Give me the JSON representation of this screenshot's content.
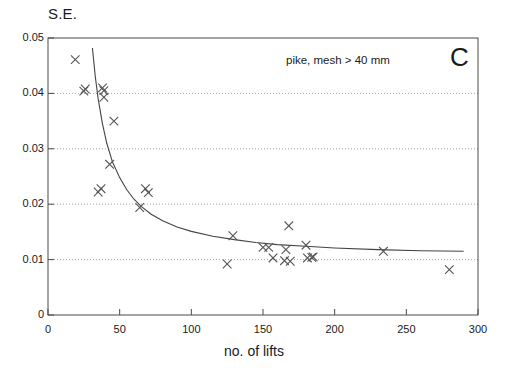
{
  "chart_data": {
    "type": "scatter",
    "title": "",
    "annotation": "pike, mesh > 40 mm",
    "panel_label": "C",
    "xlabel": "no. of lifts",
    "ylabel": "S.E.",
    "xlim": [
      0,
      300
    ],
    "ylim": [
      0,
      0.05
    ],
    "xticks": [
      0,
      50,
      100,
      150,
      200,
      250,
      300
    ],
    "xticklabels": [
      "0",
      "50",
      "100",
      "150",
      "200",
      "250",
      "300"
    ],
    "yticks": [
      0,
      0.01,
      0.02,
      0.03,
      0.04,
      0.05
    ],
    "yticklabels": [
      "0",
      "0.01",
      "0.02",
      "0.03",
      "0.04",
      "0.05"
    ],
    "grid": "horizontal-dotted",
    "gridlines_y": [
      0.01,
      0.02,
      0.03,
      0.04
    ],
    "legend": "none",
    "marker": "x",
    "marker_color": "#555555",
    "line_color": "#444444",
    "points": [
      {
        "x": 19,
        "y": 0.0461
      },
      {
        "x": 25,
        "y": 0.0404
      },
      {
        "x": 26,
        "y": 0.0408
      },
      {
        "x": 38,
        "y": 0.041
      },
      {
        "x": 39,
        "y": 0.0405
      },
      {
        "x": 39,
        "y": 0.0393
      },
      {
        "x": 46,
        "y": 0.035
      },
      {
        "x": 43,
        "y": 0.0272
      },
      {
        "x": 35,
        "y": 0.0222
      },
      {
        "x": 37,
        "y": 0.0228
      },
      {
        "x": 68,
        "y": 0.0228
      },
      {
        "x": 70,
        "y": 0.0221
      },
      {
        "x": 64,
        "y": 0.0194
      },
      {
        "x": 129,
        "y": 0.0143
      },
      {
        "x": 125,
        "y": 0.0092
      },
      {
        "x": 150,
        "y": 0.0122
      },
      {
        "x": 154,
        "y": 0.0122
      },
      {
        "x": 157,
        "y": 0.0103
      },
      {
        "x": 166,
        "y": 0.0118
      },
      {
        "x": 165,
        "y": 0.0098
      },
      {
        "x": 169,
        "y": 0.0097
      },
      {
        "x": 168,
        "y": 0.0161
      },
      {
        "x": 180,
        "y": 0.0126
      },
      {
        "x": 181,
        "y": 0.0103
      },
      {
        "x": 184,
        "y": 0.0104
      },
      {
        "x": 185,
        "y": 0.0105
      },
      {
        "x": 234,
        "y": 0.0115
      },
      {
        "x": 280,
        "y": 0.0082
      }
    ],
    "fitted_curve": {
      "description": "decaying fitted curve through scatter",
      "x_start": 31,
      "x_end": 290,
      "points": [
        {
          "x": 31,
          "y": 0.0482
        },
        {
          "x": 33,
          "y": 0.043
        },
        {
          "x": 35,
          "y": 0.039
        },
        {
          "x": 38,
          "y": 0.0345
        },
        {
          "x": 41,
          "y": 0.031
        },
        {
          "x": 45,
          "y": 0.0276
        },
        {
          "x": 50,
          "y": 0.0248
        },
        {
          "x": 55,
          "y": 0.0226
        },
        {
          "x": 60,
          "y": 0.0209
        },
        {
          "x": 65,
          "y": 0.0196
        },
        {
          "x": 72,
          "y": 0.0182
        },
        {
          "x": 80,
          "y": 0.017
        },
        {
          "x": 90,
          "y": 0.0159
        },
        {
          "x": 100,
          "y": 0.0151
        },
        {
          "x": 115,
          "y": 0.0142
        },
        {
          "x": 130,
          "y": 0.0136
        },
        {
          "x": 145,
          "y": 0.0131
        },
        {
          "x": 160,
          "y": 0.0127
        },
        {
          "x": 180,
          "y": 0.0124
        },
        {
          "x": 200,
          "y": 0.0121
        },
        {
          "x": 230,
          "y": 0.0118
        },
        {
          "x": 260,
          "y": 0.0116
        },
        {
          "x": 290,
          "y": 0.0115
        }
      ]
    }
  }
}
